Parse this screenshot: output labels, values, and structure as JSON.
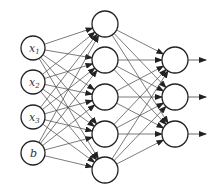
{
  "diagram": {
    "title": "",
    "colors": {
      "stroke": "#222222",
      "edge": "#444444",
      "background": "#ffffff"
    },
    "layers": [
      {
        "name": "input",
        "x": 33,
        "r": 12,
        "nodes": [
          {
            "label": "x",
            "sub": "1",
            "y": 48
          },
          {
            "label": "x",
            "sub": "2",
            "y": 82
          },
          {
            "label": "x",
            "sub": "3",
            "y": 117
          },
          {
            "label": "b",
            "sub": "",
            "y": 153
          }
        ]
      },
      {
        "name": "hidden",
        "x": 105,
        "r": 13,
        "nodes": [
          {
            "label": "",
            "y": 24
          },
          {
            "label": "",
            "y": 60
          },
          {
            "label": "",
            "y": 97
          },
          {
            "label": "",
            "y": 134
          },
          {
            "label": "",
            "y": 170
          }
        ]
      },
      {
        "name": "output",
        "x": 175,
        "r": 13,
        "nodes": [
          {
            "label": "",
            "y": 60
          },
          {
            "label": "",
            "y": 97
          },
          {
            "label": "",
            "y": 134
          }
        ]
      }
    ],
    "output_arrow_length": 18
  }
}
